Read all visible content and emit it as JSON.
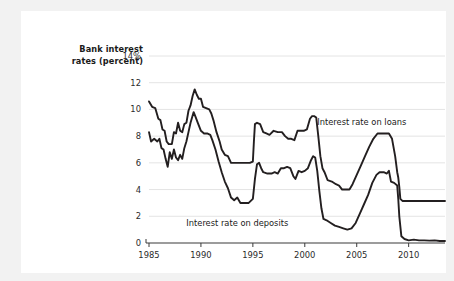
{
  "figure": {
    "background_color": "#f2f2f2",
    "card_color": "#ffffff",
    "axis_title_line1": "Bank interest",
    "axis_title_line2": "rates (percent)"
  },
  "chart_data": {
    "type": "line",
    "title": "",
    "subtitle": "",
    "xlabel": "",
    "ylabel": "Bank interest rates (percent)",
    "grid": true,
    "grid_color": "#e4e4e4",
    "legend_position": "inline-annotation",
    "line_color": "#231f20",
    "xlim": [
      1985,
      2013.5
    ],
    "ylim": [
      0,
      14
    ],
    "yticks": [
      0,
      2,
      4,
      6,
      8,
      10,
      12,
      14
    ],
    "ytick_labels": [
      "0",
      "2",
      "4",
      "6",
      "8",
      "10",
      "12",
      "14%"
    ],
    "xticks": [
      1985,
      1990,
      1995,
      2000,
      2005,
      2010
    ],
    "xtick_labels": [
      "1985",
      "1990",
      "1995",
      "2000",
      "2005",
      "2010"
    ],
    "annotations": [
      {
        "text": "Interest rate on loans",
        "x": 2001.2,
        "y": 9.0
      },
      {
        "text": "Interest rate on deposits",
        "x": 1993.6,
        "y": 1.45
      }
    ],
    "series": [
      {
        "name": "Interest rate on loans",
        "points": [
          [
            1985.0,
            10.6
          ],
          [
            1985.3,
            10.2
          ],
          [
            1985.6,
            10.1
          ],
          [
            1985.9,
            9.3
          ],
          [
            1986.1,
            9.2
          ],
          [
            1986.3,
            8.5
          ],
          [
            1986.5,
            8.4
          ],
          [
            1986.7,
            7.6
          ],
          [
            1986.9,
            7.4
          ],
          [
            1987.2,
            7.4
          ],
          [
            1987.4,
            8.3
          ],
          [
            1987.6,
            8.2
          ],
          [
            1987.8,
            9.0
          ],
          [
            1988.0,
            8.4
          ],
          [
            1988.2,
            8.3
          ],
          [
            1988.4,
            8.9
          ],
          [
            1988.6,
            9.0
          ],
          [
            1988.8,
            9.9
          ],
          [
            1989.0,
            10.3
          ],
          [
            1989.2,
            11.0
          ],
          [
            1989.4,
            11.5
          ],
          [
            1989.6,
            11.1
          ],
          [
            1989.8,
            10.8
          ],
          [
            1990.0,
            10.8
          ],
          [
            1990.2,
            10.2
          ],
          [
            1990.5,
            10.1
          ],
          [
            1990.8,
            10.0
          ],
          [
            1991.0,
            9.7
          ],
          [
            1991.2,
            9.2
          ],
          [
            1991.5,
            8.3
          ],
          [
            1991.8,
            7.6
          ],
          [
            1992.0,
            7.0
          ],
          [
            1992.3,
            6.6
          ],
          [
            1992.6,
            6.5
          ],
          [
            1992.9,
            6.0
          ],
          [
            1993.3,
            6.0
          ],
          [
            1993.8,
            6.0
          ],
          [
            1994.3,
            6.0
          ],
          [
            1994.7,
            6.0
          ],
          [
            1995.0,
            6.1
          ],
          [
            1995.1,
            7.6
          ],
          [
            1995.2,
            8.9
          ],
          [
            1995.4,
            9.0
          ],
          [
            1995.7,
            8.9
          ],
          [
            1996.0,
            8.3
          ],
          [
            1996.3,
            8.2
          ],
          [
            1996.6,
            8.1
          ],
          [
            1997.0,
            8.4
          ],
          [
            1997.4,
            8.3
          ],
          [
            1997.8,
            8.3
          ],
          [
            1998.1,
            8.0
          ],
          [
            1998.4,
            7.8
          ],
          [
            1998.7,
            7.8
          ],
          [
            1999.0,
            7.7
          ],
          [
            1999.3,
            8.4
          ],
          [
            1999.6,
            8.4
          ],
          [
            1999.9,
            8.4
          ],
          [
            2000.2,
            8.5
          ],
          [
            2000.5,
            9.3
          ],
          [
            2000.7,
            9.5
          ],
          [
            2000.9,
            9.5
          ],
          [
            2001.1,
            9.4
          ],
          [
            2001.3,
            8.0
          ],
          [
            2001.5,
            6.5
          ],
          [
            2001.7,
            5.6
          ],
          [
            2001.9,
            5.3
          ],
          [
            2002.2,
            4.7
          ],
          [
            2002.6,
            4.6
          ],
          [
            2003.0,
            4.4
          ],
          [
            2003.3,
            4.3
          ],
          [
            2003.6,
            4.0
          ],
          [
            2004.0,
            4.0
          ],
          [
            2004.3,
            4.0
          ],
          [
            2004.6,
            4.4
          ],
          [
            2005.0,
            5.1
          ],
          [
            2005.4,
            5.8
          ],
          [
            2005.8,
            6.5
          ],
          [
            2006.2,
            7.2
          ],
          [
            2006.6,
            7.8
          ],
          [
            2007.0,
            8.2
          ],
          [
            2007.4,
            8.2
          ],
          [
            2007.8,
            8.2
          ],
          [
            2008.1,
            8.2
          ],
          [
            2008.4,
            7.8
          ],
          [
            2008.7,
            6.5
          ],
          [
            2008.9,
            5.3
          ],
          [
            2009.0,
            4.9
          ],
          [
            2009.1,
            4.2
          ],
          [
            2009.2,
            3.3
          ],
          [
            2009.4,
            3.15
          ],
          [
            2010.0,
            3.15
          ],
          [
            2011.0,
            3.15
          ],
          [
            2012.0,
            3.15
          ],
          [
            2013.0,
            3.15
          ],
          [
            2013.5,
            3.15
          ]
        ]
      },
      {
        "name": "Interest rate on deposits",
        "points": [
          [
            1985.0,
            8.3
          ],
          [
            1985.2,
            7.6
          ],
          [
            1985.5,
            7.8
          ],
          [
            1985.8,
            7.6
          ],
          [
            1986.0,
            7.8
          ],
          [
            1986.2,
            7.1
          ],
          [
            1986.4,
            7.0
          ],
          [
            1986.6,
            6.3
          ],
          [
            1986.8,
            5.7
          ],
          [
            1987.0,
            6.8
          ],
          [
            1987.2,
            6.3
          ],
          [
            1987.4,
            7.0
          ],
          [
            1987.6,
            6.4
          ],
          [
            1987.8,
            6.2
          ],
          [
            1988.0,
            6.6
          ],
          [
            1988.2,
            6.3
          ],
          [
            1988.4,
            7.1
          ],
          [
            1988.6,
            7.6
          ],
          [
            1988.8,
            8.3
          ],
          [
            1989.0,
            9.0
          ],
          [
            1989.3,
            9.8
          ],
          [
            1989.5,
            9.4
          ],
          [
            1989.7,
            9.0
          ],
          [
            1990.0,
            8.4
          ],
          [
            1990.3,
            8.2
          ],
          [
            1990.6,
            8.2
          ],
          [
            1990.9,
            8.1
          ],
          [
            1991.1,
            7.7
          ],
          [
            1991.4,
            7.0
          ],
          [
            1991.7,
            6.1
          ],
          [
            1992.0,
            5.3
          ],
          [
            1992.3,
            4.6
          ],
          [
            1992.6,
            4.1
          ],
          [
            1992.9,
            3.4
          ],
          [
            1993.2,
            3.2
          ],
          [
            1993.5,
            3.4
          ],
          [
            1993.8,
            3.0
          ],
          [
            1994.2,
            3.0
          ],
          [
            1994.6,
            3.0
          ],
          [
            1995.0,
            3.3
          ],
          [
            1995.2,
            4.8
          ],
          [
            1995.4,
            5.9
          ],
          [
            1995.6,
            6.0
          ],
          [
            1995.8,
            5.6
          ],
          [
            1996.0,
            5.3
          ],
          [
            1996.4,
            5.2
          ],
          [
            1996.8,
            5.2
          ],
          [
            1997.1,
            5.3
          ],
          [
            1997.4,
            5.2
          ],
          [
            1997.7,
            5.6
          ],
          [
            1998.0,
            5.6
          ],
          [
            1998.3,
            5.7
          ],
          [
            1998.6,
            5.6
          ],
          [
            1998.9,
            5.0
          ],
          [
            1999.1,
            4.8
          ],
          [
            1999.4,
            5.4
          ],
          [
            1999.7,
            5.3
          ],
          [
            2000.0,
            5.4
          ],
          [
            2000.3,
            5.6
          ],
          [
            2000.6,
            6.2
          ],
          [
            2000.8,
            6.5
          ],
          [
            2001.0,
            6.4
          ],
          [
            2001.2,
            5.4
          ],
          [
            2001.4,
            3.9
          ],
          [
            2001.6,
            2.6
          ],
          [
            2001.8,
            1.8
          ],
          [
            2002.1,
            1.7
          ],
          [
            2002.5,
            1.5
          ],
          [
            2002.9,
            1.3
          ],
          [
            2003.3,
            1.2
          ],
          [
            2003.7,
            1.1
          ],
          [
            2004.1,
            1.0
          ],
          [
            2004.5,
            1.1
          ],
          [
            2004.9,
            1.5
          ],
          [
            2005.3,
            2.2
          ],
          [
            2005.7,
            2.9
          ],
          [
            2006.1,
            3.6
          ],
          [
            2006.5,
            4.5
          ],
          [
            2006.9,
            5.1
          ],
          [
            2007.2,
            5.3
          ],
          [
            2007.6,
            5.3
          ],
          [
            2007.9,
            5.2
          ],
          [
            2008.1,
            5.4
          ],
          [
            2008.3,
            4.6
          ],
          [
            2008.6,
            4.5
          ],
          [
            2008.9,
            4.3
          ],
          [
            2009.0,
            3.3
          ],
          [
            2009.1,
            2.0
          ],
          [
            2009.3,
            0.5
          ],
          [
            2009.6,
            0.3
          ],
          [
            2010.0,
            0.2
          ],
          [
            2010.5,
            0.25
          ],
          [
            2011.0,
            0.2
          ],
          [
            2011.5,
            0.2
          ],
          [
            2012.0,
            0.18
          ],
          [
            2012.5,
            0.2
          ],
          [
            2013.0,
            0.15
          ],
          [
            2013.5,
            0.15
          ]
        ]
      }
    ]
  }
}
